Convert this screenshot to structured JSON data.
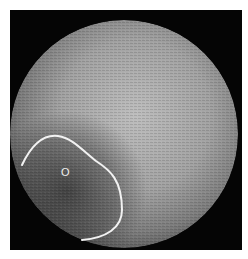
{
  "image": {
    "description": "Grayscale circular microscopy field with outlined region",
    "background_color": "#050505",
    "field": {
      "shape": "circle",
      "center": [
        114,
        124
      ],
      "radius": 114,
      "brightness_center": "#b8b8b8",
      "brightness_edge": "#5a5a5a",
      "dark_region_color": "#3a3a3a"
    },
    "region_outline": {
      "color": "#f2f2f2",
      "stroke_width": 2
    },
    "marker": {
      "label": "O",
      "color": "#f0f0f0",
      "x": 51,
      "y": 157
    }
  }
}
